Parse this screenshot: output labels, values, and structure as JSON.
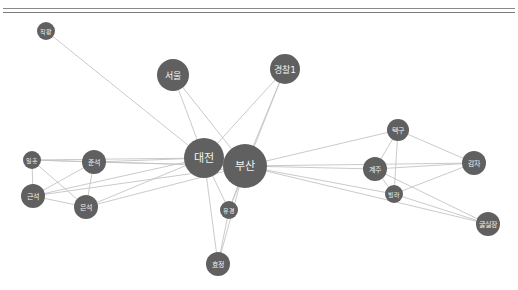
{
  "diagram": {
    "type": "network-graph",
    "node_color": "#606060",
    "edge_color": "#c4c4c4",
    "label_color": "#f2f2f2",
    "nodes": [
      {
        "id": "jigwang",
        "label": "직왕",
        "x": 46,
        "y": 31,
        "r": 9
      },
      {
        "id": "seoul",
        "label": "서울",
        "x": 173,
        "y": 75,
        "r": 16
      },
      {
        "id": "police1",
        "label": "경찰1",
        "x": 285,
        "y": 69,
        "r": 15
      },
      {
        "id": "daejeon",
        "label": "대전",
        "x": 204,
        "y": 158,
        "r": 20
      },
      {
        "id": "busan",
        "label": "부산",
        "x": 245,
        "y": 166,
        "r": 22
      },
      {
        "id": "ilhong",
        "label": "일홍",
        "x": 32,
        "y": 160,
        "r": 9
      },
      {
        "id": "junseok",
        "label": "준석",
        "x": 94,
        "y": 162,
        "r": 12
      },
      {
        "id": "geunseok",
        "label": "근석",
        "x": 33,
        "y": 196,
        "r": 12
      },
      {
        "id": "eunseok",
        "label": "은석",
        "x": 86,
        "y": 207,
        "r": 12
      },
      {
        "id": "yugyeong",
        "label": "유경",
        "x": 229,
        "y": 210,
        "r": 9
      },
      {
        "id": "hyojeong",
        "label": "효정",
        "x": 218,
        "y": 264,
        "r": 12
      },
      {
        "id": "taekgu",
        "label": "택구",
        "x": 398,
        "y": 130,
        "r": 11
      },
      {
        "id": "gyeju",
        "label": "계주",
        "x": 375,
        "y": 169,
        "r": 12
      },
      {
        "id": "gamja",
        "label": "감자",
        "x": 474,
        "y": 163,
        "r": 12
      },
      {
        "id": "villa",
        "label": "빌라",
        "x": 394,
        "y": 194,
        "r": 9
      },
      {
        "id": "gulsiljang",
        "label": "굴실장",
        "x": 488,
        "y": 224,
        "r": 12
      }
    ],
    "edges": [
      [
        "jigwang",
        "daejeon"
      ],
      [
        "seoul",
        "daejeon"
      ],
      [
        "seoul",
        "busan"
      ],
      [
        "police1",
        "daejeon"
      ],
      [
        "police1",
        "busan"
      ],
      [
        "police1",
        "yugyeong"
      ],
      [
        "daejeon",
        "busan"
      ],
      [
        "ilhong",
        "junseok"
      ],
      [
        "ilhong",
        "daejeon"
      ],
      [
        "ilhong",
        "busan"
      ],
      [
        "ilhong",
        "geunseok"
      ],
      [
        "ilhong",
        "eunseok"
      ],
      [
        "junseok",
        "daejeon"
      ],
      [
        "junseok",
        "busan"
      ],
      [
        "junseok",
        "geunseok"
      ],
      [
        "junseok",
        "eunseok"
      ],
      [
        "geunseok",
        "daejeon"
      ],
      [
        "geunseok",
        "busan"
      ],
      [
        "geunseok",
        "eunseok"
      ],
      [
        "eunseok",
        "daejeon"
      ],
      [
        "eunseok",
        "busan"
      ],
      [
        "daejeon",
        "yugyeong"
      ],
      [
        "daejeon",
        "hyojeong"
      ],
      [
        "busan",
        "yugyeong"
      ],
      [
        "busan",
        "hyojeong"
      ],
      [
        "yugyeong",
        "hyojeong"
      ],
      [
        "busan",
        "taekgu"
      ],
      [
        "busan",
        "gyeju"
      ],
      [
        "busan",
        "gamja"
      ],
      [
        "busan",
        "villa"
      ],
      [
        "busan",
        "gulsiljang"
      ],
      [
        "taekgu",
        "gyeju"
      ],
      [
        "taekgu",
        "villa"
      ],
      [
        "taekgu",
        "gamja"
      ],
      [
        "gyeju",
        "gamja"
      ],
      [
        "gyeju",
        "villa"
      ],
      [
        "gyeju",
        "gulsiljang"
      ],
      [
        "villa",
        "gamja"
      ],
      [
        "villa",
        "gulsiljang"
      ]
    ]
  }
}
